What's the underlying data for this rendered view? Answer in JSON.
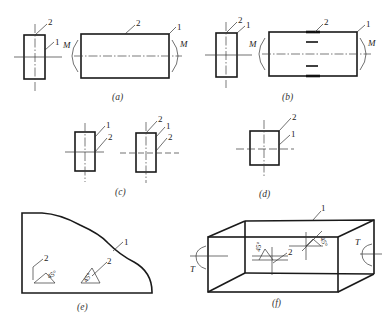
{
  "figure": {
    "panels": [
      {
        "id": "a",
        "caption": "(a)",
        "labels": {
          "one": "1",
          "two": "2",
          "moment": "M"
        }
      },
      {
        "id": "b",
        "caption": "(b)",
        "labels": {
          "one": "1",
          "two": "2",
          "moment": "M"
        }
      },
      {
        "id": "c",
        "caption": "(c)",
        "labels": {
          "one": "1",
          "two": "2"
        }
      },
      {
        "id": "d",
        "caption": "(d)",
        "labels": {
          "one": "1",
          "two": "2"
        }
      },
      {
        "id": "e",
        "caption": "(e)",
        "labels": {
          "one": "1",
          "two": "2",
          "angle": "45°"
        }
      },
      {
        "id": "f",
        "caption": "(f)",
        "labels": {
          "one": "1",
          "two": "2",
          "angle": "45°",
          "torque": "T"
        }
      }
    ]
  }
}
